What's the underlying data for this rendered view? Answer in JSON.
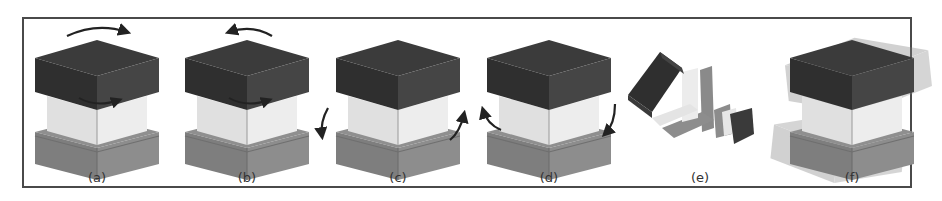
{
  "figure": {
    "panels": [
      {
        "id": "a",
        "label": "(a)",
        "center_x": 97,
        "mode": "top-block-rotation-clockwise"
      },
      {
        "id": "b",
        "label": "(b)",
        "center_x": 247,
        "mode": "top-block-rotation-counterclockwise"
      },
      {
        "id": "c",
        "label": "(c)",
        "center_x": 398,
        "mode": "bottom-block-rotation-clockwise"
      },
      {
        "id": "d",
        "label": "(d)",
        "center_x": 549,
        "mode": "bottom-block-rotation-counterclockwise"
      },
      {
        "id": "e",
        "label": "(e)",
        "center_x": 700,
        "mode": "exploded-view"
      },
      {
        "id": "f",
        "label": "(f)",
        "center_x": 852,
        "mode": "superimposed-displacements"
      }
    ],
    "colors": {
      "top_block_top": "#3a3a3a",
      "top_block_left": "#2e2e2e",
      "top_block_right": "#444444",
      "middle_left": "#e2e2e2",
      "middle_right": "#ececec",
      "base_top": "#8a8a8a",
      "base_left": "#7d7d7d",
      "base_right": "#8c8c8c",
      "arrow": "#222222",
      "frame": "#4a4a4a"
    }
  }
}
